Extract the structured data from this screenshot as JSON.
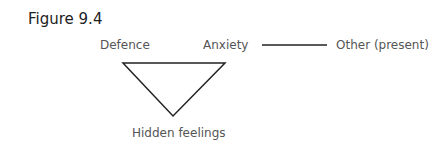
{
  "figure": {
    "title": "Figure 9.4",
    "nodes": {
      "defence": "Defence",
      "anxiety": "Anxiety",
      "other": "Other (present)",
      "hidden": "Hidden feelings"
    },
    "edges": [
      {
        "from": "defence",
        "to": "anxiety",
        "shape": "triangle-top"
      },
      {
        "from": "anxiety",
        "to": "hidden",
        "shape": "triangle-right"
      },
      {
        "from": "defence",
        "to": "hidden",
        "shape": "triangle-left"
      },
      {
        "from": "anxiety",
        "to": "other",
        "shape": "line"
      }
    ],
    "stroke_color": "#222222"
  }
}
